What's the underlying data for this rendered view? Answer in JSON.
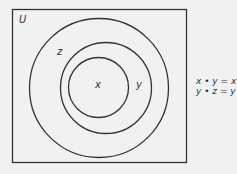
{
  "diagram": {
    "type": "venn",
    "universe_label": "U",
    "sets": [
      {
        "name": "z",
        "label": "z"
      },
      {
        "name": "y",
        "label": "y"
      },
      {
        "name": "x",
        "label": "x"
      }
    ],
    "equations": [
      "x • y = x",
      "y • z = y"
    ],
    "colors": {
      "stroke": "#333333",
      "background": "#f1f1f1"
    }
  }
}
